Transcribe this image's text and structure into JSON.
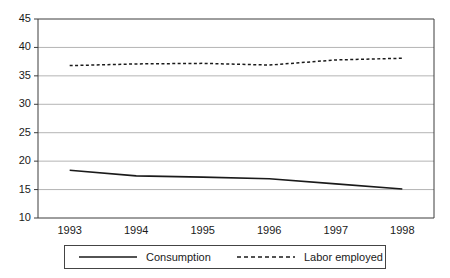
{
  "chart_data": {
    "type": "line",
    "title": "",
    "xlabel": "",
    "ylabel": "",
    "x": [
      "1993",
      "1994",
      "1995",
      "1996",
      "1997",
      "1998"
    ],
    "categories": [
      "1993",
      "1994",
      "1995",
      "1996",
      "1997",
      "1998"
    ],
    "ylim": [
      10,
      45
    ],
    "yticks": [
      10,
      15,
      20,
      25,
      30,
      35,
      40,
      45
    ],
    "ytick_labels": [
      "10",
      "15",
      "20",
      "25",
      "30",
      "35",
      "40",
      "45"
    ],
    "grid": "horizontal",
    "legend_position": "bottom",
    "series": [
      {
        "name": "Consumption",
        "style": "solid",
        "color": "#1a1a1a",
        "values": [
          18.4,
          17.4,
          17.2,
          16.9,
          16.0,
          15.1
        ]
      },
      {
        "name": "Labor employed",
        "style": "dashed",
        "color": "#1a1a1a",
        "values": [
          36.8,
          37.1,
          37.2,
          36.9,
          37.8,
          38.1
        ]
      }
    ]
  },
  "legend": {
    "entries": [
      {
        "label": "Consumption",
        "style": "solid"
      },
      {
        "label": "Labor employed",
        "style": "dashed"
      }
    ]
  },
  "colors": {
    "line": "#1a1a1a",
    "grid": "#b4b4b4",
    "axis": "#3c3c3c",
    "background": "#ffffff"
  }
}
